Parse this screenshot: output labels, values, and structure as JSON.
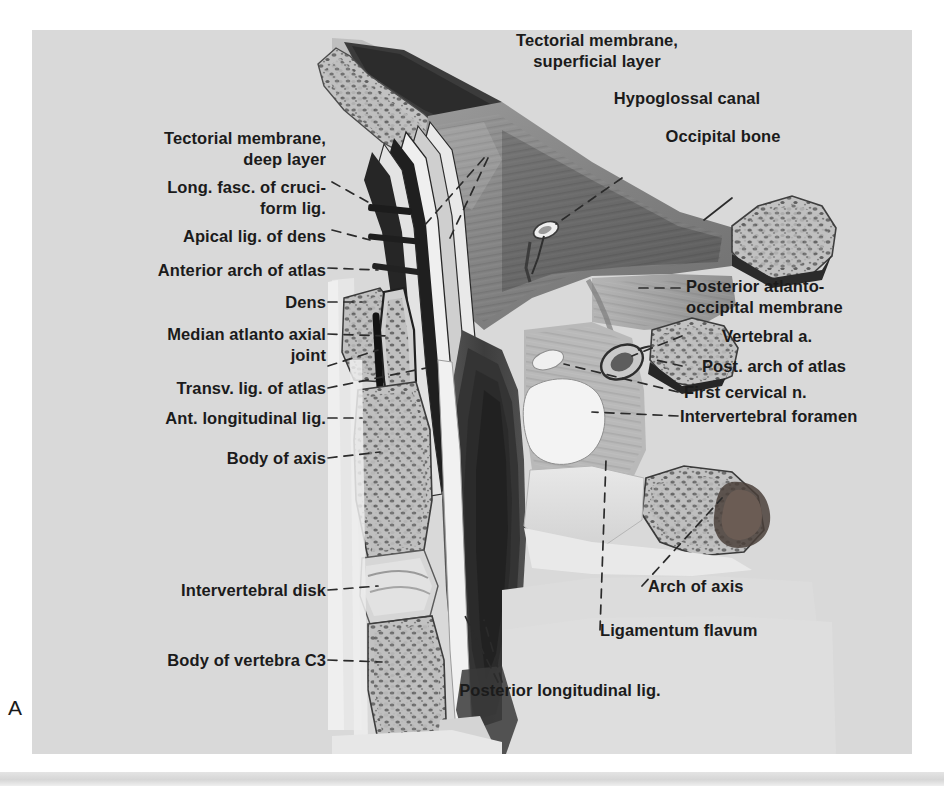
{
  "figure": {
    "letter": "A",
    "background_color": "#d9d9d9",
    "text_color": "#1b1b1b"
  },
  "labels_left": [
    {
      "id": "tectorial-membrane-deep-layer",
      "lines": "Tectorial membrane,\n    deep layer"
    },
    {
      "id": "long-fasc-cruciform-lig",
      "lines": "Long. fasc. of cruci-\n        form lig."
    },
    {
      "id": "apical-lig-of-dens",
      "lines": "Apical lig. of dens"
    },
    {
      "id": "anterior-arch-of-atlas",
      "lines": "Anterior arch of atlas"
    },
    {
      "id": "dens",
      "lines": "Dens"
    },
    {
      "id": "median-atlantoaxial-joint",
      "lines": "Median atlanto axial\n           joint"
    },
    {
      "id": "transv-lig-of-atlas",
      "lines": "Transv. lig. of atlas"
    },
    {
      "id": "ant-longitudinal-lig",
      "lines": "Ant. longitudinal lig."
    },
    {
      "id": "body-of-axis",
      "lines": "Body of axis"
    },
    {
      "id": "intervertebral-disk",
      "lines": "Intervertebral disk"
    },
    {
      "id": "body-of-vertebra-c3",
      "lines": "Body of vertebra C3"
    }
  ],
  "labels_top": [
    {
      "id": "tectorial-membrane-superficial-layer",
      "lines": "Tectorial membrane,\nsuperficial layer"
    },
    {
      "id": "hypoglossal-canal",
      "lines": "Hypoglossal canal"
    },
    {
      "id": "occipital-bone",
      "lines": "Occipital bone"
    }
  ],
  "labels_right": [
    {
      "id": "posterior-atlanto-occipital-membrane",
      "lines": "Posterior atlanto-\noccipital membrane"
    },
    {
      "id": "vertebral-a",
      "lines": "Vertebral a."
    },
    {
      "id": "post-arch-of-atlas",
      "lines": "Post. arch of atlas"
    },
    {
      "id": "first-cervical-n",
      "lines": "First cervical n."
    },
    {
      "id": "intervertebral-foramen",
      "lines": "Intervertebral foramen"
    },
    {
      "id": "arch-of-axis",
      "lines": "Arch of axis"
    },
    {
      "id": "ligamentum-flavum",
      "lines": "Ligamentum flavum"
    }
  ],
  "labels_bottom": [
    {
      "id": "posterior-longitudinal-lig",
      "lines": "Posterior longitudinal lig."
    }
  ]
}
